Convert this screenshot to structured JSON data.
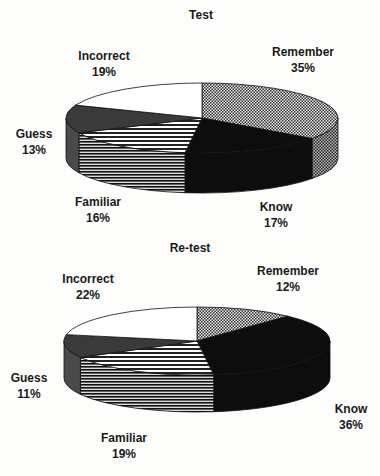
{
  "chart_data": [
    {
      "type": "pie",
      "title": "Test",
      "style": "3d",
      "categories": [
        "Remember",
        "Know",
        "Familiar",
        "Guess",
        "Incorrect"
      ],
      "values": [
        35,
        17,
        16,
        13,
        19
      ],
      "labels": [
        {
          "name": "Remember",
          "pct": "35%"
        },
        {
          "name": "Know",
          "pct": "17%"
        },
        {
          "name": "Familiar",
          "pct": "16%"
        },
        {
          "name": "Guess",
          "pct": "13%"
        },
        {
          "name": "Incorrect",
          "pct": "19%"
        }
      ]
    },
    {
      "type": "pie",
      "title": "Re-test",
      "style": "3d",
      "categories": [
        "Remember",
        "Know",
        "Familiar",
        "Guess",
        "Incorrect"
      ],
      "values": [
        12,
        36,
        19,
        11,
        22
      ],
      "labels": [
        {
          "name": "Remember",
          "pct": "12%"
        },
        {
          "name": "Know",
          "pct": "36%"
        },
        {
          "name": "Familiar",
          "pct": "19%"
        },
        {
          "name": "Guess",
          "pct": "11%"
        },
        {
          "name": "Incorrect",
          "pct": "22%"
        }
      ]
    }
  ],
  "fills": {
    "Remember": "checker",
    "Know": "#0d0d0d",
    "Familiar": "hstripes",
    "Guess": "#3a3a3a",
    "Incorrect": "#ffffff"
  }
}
